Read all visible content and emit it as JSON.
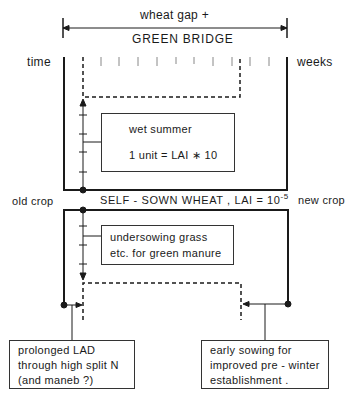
{
  "header": {
    "line1": "wheat gap  +",
    "line2": "GREEN BRIDGE"
  },
  "axis": {
    "left_label": "time",
    "right_label": "weeks"
  },
  "upper_box": {
    "title": "wet summer",
    "subtitle": "1 unit = LAI ∗ 10"
  },
  "middle": {
    "left_label": "old crop",
    "center_label": "SELF - SOWN WHEAT , LAI = 10",
    "center_exponent": "-5",
    "right_label": "new crop"
  },
  "lower_box": {
    "line1": "undersowing grass",
    "line2": "etc. for green manure"
  },
  "callouts": [
    {
      "lines": [
        "prolonged  LAD",
        "through high split N",
        "(and maneb ?)"
      ]
    },
    {
      "lines": [
        "early sowing for",
        "improved pre - winter",
        "establishment ."
      ]
    }
  ],
  "colors": {
    "ink": "#1a1a1a",
    "background": "#ffffff"
  }
}
